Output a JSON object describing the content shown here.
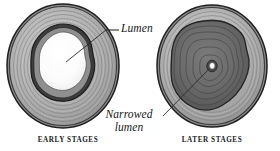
{
  "figure": {
    "background_color": "#ffffff",
    "width": 280,
    "height": 151
  },
  "callouts": [
    {
      "id": "lumen",
      "text": "Lumen",
      "style": "italic-serif",
      "points_to": "early-stage-lumen"
    },
    {
      "id": "narrowed-lumen",
      "line1": "Narrowed",
      "line2": "lumen",
      "text": "Narrowed lumen",
      "style": "italic-serif",
      "points_to": "later-stage-lumen"
    }
  ],
  "panels": [
    {
      "id": "early",
      "caption": "EARLY STAGES",
      "lumen_state": "open",
      "lumen_color": "#fbfbfb",
      "wall_color": "#9d9d9d",
      "outline_color": "#2a2a2a"
    },
    {
      "id": "later",
      "caption": "LATER STAGES",
      "lumen_state": "narrowed",
      "lumen_color": "#fdfdfd",
      "plaque_color": "#6d6d6d",
      "wall_color": "#9d9d9d",
      "outline_color": "#2a2a2a"
    }
  ],
  "colors": {
    "background": "#ffffff",
    "text": "#161616",
    "outline_dark": "#2a2a2a",
    "wall_mid": "#9d9d9d",
    "wall_light": "#c9c9c9",
    "wall_pale": "#dedede",
    "plaque_dark": "#5f5f5f",
    "lumen_white": "#fcfcfc",
    "leader_line": "#2a2a2a"
  }
}
